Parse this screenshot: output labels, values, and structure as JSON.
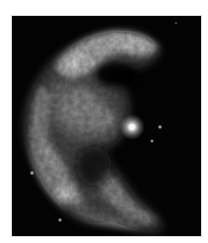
{
  "image": {
    "subject": "supernova-remnant",
    "description": "Grayscale astronomical image of a shell-shaped nebula with a bright point source",
    "background_color": "#030303",
    "page_color": "#ffffff",
    "nebula_color": "#d9d9d9",
    "point_source_color": "#ffffff"
  }
}
